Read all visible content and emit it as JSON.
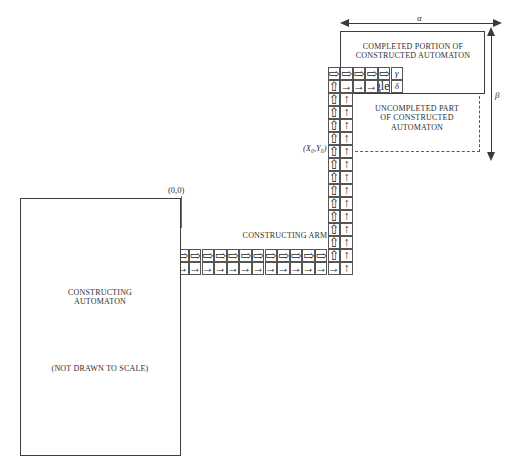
{
  "figure": {
    "background": "#ffffff",
    "line_color": "#4a4a4a"
  },
  "glyphs": {
    "double_right": "⇨",
    "single_right": "→",
    "double_up": "⇧",
    "single_up": "↑"
  },
  "completed_box": {
    "label_line1": "COMPLETED PORTION OF",
    "label_line2": "CONSTRUCTED AUTOMATON"
  },
  "uncompleted_box": {
    "label_line1": "UNCOMPLETED PART",
    "label_line2": "OF CONSTRUCTED",
    "label_line3": "AUTOMATON"
  },
  "constructing_box": {
    "label_line1": "CONSTRUCTING",
    "label_line2": "AUTOMATON",
    "note": "(NOT DRAWN TO SCALE)"
  },
  "arm": {
    "label": "CONSTRUCTING ARM"
  },
  "dimensions": {
    "horizontal": "α",
    "vertical": "β"
  },
  "markers": {
    "origin": "(0,0)",
    "start_state": "S",
    "zero_state": "0",
    "coordinate": "(X₀,Y₀)",
    "gamma": "γ",
    "delta": "δ"
  },
  "tape": {
    "head_row_top": {
      "count": 5,
      "glyph": "double_right",
      "terminator": "γ"
    },
    "head_row_bottom": {
      "count": 1,
      "first_glyph": "double_up",
      "mid_glyph": "single_right",
      "mid_count": 3,
      "last_glyph": "single_up",
      "terminator": "δ"
    },
    "vertical_column_left": {
      "count": 12,
      "glyph": "double_up"
    },
    "vertical_column_right": {
      "count": 12,
      "glyph": "single_up"
    },
    "arm_row_top": {
      "count": 16,
      "glyph": "double_right"
    },
    "arm_row_bottom": {
      "count": 16,
      "glyph": "single_right"
    }
  }
}
